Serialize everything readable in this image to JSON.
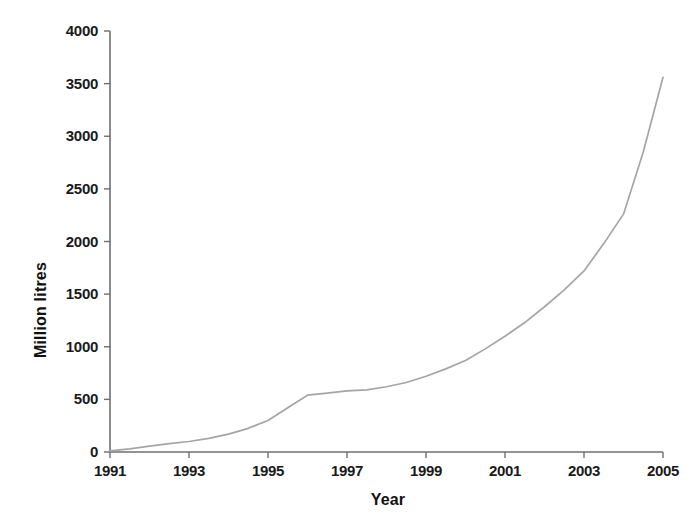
{
  "chart_data": {
    "type": "line",
    "title": "",
    "xlabel": "Year",
    "ylabel": "Million litres",
    "xlim": [
      1991,
      2005
    ],
    "ylim": [
      0,
      4000
    ],
    "grid": false,
    "legend": null,
    "legend_position": "none",
    "line_color": "#a5a5a5",
    "axis_color": "#6f6f6f",
    "text_color": "#1a1a1a",
    "x_tick_labels": [
      "1991",
      "1993",
      "1995",
      "1997",
      "1999",
      "2001",
      "2003",
      "2005"
    ],
    "x_tick_values": [
      1991,
      1993,
      1995,
      1997,
      1999,
      2001,
      2003,
      2005
    ],
    "x_minor_step": 1,
    "y_tick_labels": [
      "0",
      "500",
      "1000",
      "1500",
      "2000",
      "2500",
      "3000",
      "3500",
      "4000"
    ],
    "y_tick_values": [
      0,
      500,
      1000,
      1500,
      2000,
      2500,
      3000,
      3500,
      4000
    ],
    "x": [
      1991,
      1991.5,
      1992,
      1992.5,
      1993,
      1993.5,
      1994,
      1994.5,
      1995,
      1995.5,
      1996,
      1996.5,
      1997,
      1997.5,
      1998,
      1998.5,
      1999,
      1999.5,
      2000,
      2000.5,
      2001,
      2001.5,
      2002,
      2002.5,
      2003,
      2003.5,
      2004,
      2004.5,
      2005
    ],
    "values": [
      10,
      30,
      55,
      80,
      100,
      130,
      170,
      225,
      300,
      420,
      540,
      560,
      580,
      590,
      620,
      660,
      720,
      790,
      870,
      980,
      1100,
      1230,
      1380,
      1540,
      1720,
      1980,
      2260,
      2850,
      3560
    ],
    "series": [
      {
        "name": "Million litres",
        "values": [
          10,
          30,
          55,
          80,
          100,
          130,
          170,
          225,
          300,
          420,
          540,
          560,
          580,
          590,
          620,
          660,
          720,
          790,
          870,
          980,
          1100,
          1230,
          1380,
          1540,
          1720,
          1980,
          2260,
          2850,
          3560
        ]
      }
    ],
    "annotations": []
  }
}
